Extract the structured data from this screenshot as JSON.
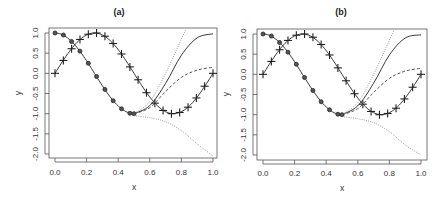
{
  "chart_data": [
    {
      "type": "line",
      "title": "(a)",
      "xlabel": "x",
      "ylabel": "y",
      "xlim": [
        0,
        1
      ],
      "ylim": [
        -2.1,
        1.1
      ],
      "xticks": [
        "0.0",
        "0.2",
        "0.4",
        "0.6",
        "0.8",
        "1.0"
      ],
      "yticks": [
        "1.0",
        "0.5",
        "0.0",
        "-0.5",
        "-1.0",
        "-1.5",
        "-2.0"
      ],
      "grid": false,
      "series": [
        {
          "name": "sin(2*pi*x) with + markers",
          "style": "solid",
          "marker": "+",
          "x": [
            0,
            0.053,
            0.105,
            0.158,
            0.211,
            0.263,
            0.316,
            0.368,
            0.421,
            0.474,
            0.526,
            0.579,
            0.632,
            0.684,
            0.737,
            0.789,
            0.842,
            0.895,
            0.947,
            1.0
          ],
          "y": [
            0,
            0.32,
            0.61,
            0.84,
            0.97,
            1.0,
            0.92,
            0.74,
            0.48,
            0.16,
            -0.16,
            -0.48,
            -0.74,
            -0.92,
            -1.0,
            -0.97,
            -0.84,
            -0.61,
            -0.32,
            0
          ]
        },
        {
          "name": "cos(2*pi*x) with circle markers",
          "style": "solid",
          "marker": "o",
          "x": [
            0,
            0.053,
            0.105,
            0.158,
            0.211,
            0.263,
            0.316,
            0.368,
            0.421,
            0.474,
            0.5
          ],
          "y": [
            1.0,
            0.95,
            0.79,
            0.55,
            0.25,
            -0.08,
            -0.4,
            -0.68,
            -0.88,
            -0.99,
            -1.0
          ]
        },
        {
          "name": "extrapolation solid",
          "style": "solid",
          "x": [
            0.5,
            0.6,
            0.7,
            0.8,
            0.9,
            1.0
          ],
          "y": [
            -1.0,
            -0.8,
            -0.25,
            0.45,
            0.88,
            0.98
          ]
        },
        {
          "name": "extrapolation dashed",
          "style": "dashed",
          "x": [
            0.5,
            0.6,
            0.7,
            0.8,
            0.9,
            1.0
          ],
          "y": [
            -1.0,
            -0.85,
            -0.45,
            -0.1,
            0.08,
            0.15
          ]
        },
        {
          "name": "extrapolation dotted up",
          "style": "dotted",
          "x": [
            0.5,
            0.6,
            0.7,
            0.8,
            0.83
          ],
          "y": [
            -1.0,
            -0.7,
            0.0,
            0.85,
            1.1
          ]
        },
        {
          "name": "extrapolation dotted down",
          "style": "dotted",
          "x": [
            0.5,
            0.6,
            0.7,
            0.8,
            0.9,
            1.0
          ],
          "y": [
            -1.05,
            -1.1,
            -1.2,
            -1.42,
            -1.75,
            -2.05
          ]
        }
      ]
    },
    {
      "type": "line",
      "title": "(b)",
      "xlabel": "x",
      "ylabel": "y",
      "xlim": [
        0,
        1
      ],
      "ylim": [
        -2.1,
        1.1
      ],
      "xticks": [
        "0.0",
        "0.2",
        "0.4",
        "0.6",
        "0.8",
        "1.0"
      ],
      "yticks": [
        "1.0",
        "0.5",
        "0.0",
        "-0.5",
        "-1.0",
        "-1.5",
        "-2.0"
      ],
      "grid": false,
      "series": [
        {
          "name": "sin(2*pi*x) with + markers",
          "style": "solid",
          "marker": "+",
          "x": [
            0,
            0.053,
            0.105,
            0.158,
            0.211,
            0.263,
            0.316,
            0.368,
            0.421,
            0.474,
            0.526,
            0.579,
            0.632,
            0.684,
            0.737,
            0.789,
            0.842,
            0.895,
            0.947,
            1.0
          ],
          "y": [
            0,
            0.32,
            0.61,
            0.84,
            0.97,
            1.0,
            0.92,
            0.74,
            0.48,
            0.16,
            -0.16,
            -0.48,
            -0.74,
            -0.92,
            -1.0,
            -0.97,
            -0.84,
            -0.61,
            -0.32,
            0
          ]
        },
        {
          "name": "cos(2*pi*x) with circle markers",
          "style": "solid",
          "marker": "o",
          "x": [
            0,
            0.053,
            0.105,
            0.158,
            0.211,
            0.263,
            0.316,
            0.368,
            0.421,
            0.474,
            0.5
          ],
          "y": [
            1.0,
            0.95,
            0.79,
            0.55,
            0.25,
            -0.08,
            -0.4,
            -0.68,
            -0.88,
            -0.99,
            -1.0
          ]
        },
        {
          "name": "extrapolation solid",
          "style": "solid",
          "x": [
            0.5,
            0.6,
            0.7,
            0.8,
            0.9,
            1.0
          ],
          "y": [
            -1.0,
            -0.78,
            -0.22,
            0.48,
            0.9,
            0.98
          ]
        },
        {
          "name": "extrapolation dashed",
          "style": "dashed",
          "x": [
            0.5,
            0.6,
            0.7,
            0.8,
            0.9,
            1.0
          ],
          "y": [
            -1.0,
            -0.85,
            -0.45,
            -0.1,
            0.08,
            0.15
          ]
        },
        {
          "name": "extrapolation dotted up",
          "style": "dotted",
          "x": [
            0.5,
            0.6,
            0.7,
            0.8,
            0.83
          ],
          "y": [
            -1.0,
            -0.7,
            0.0,
            0.85,
            1.1
          ]
        },
        {
          "name": "extrapolation dotted down",
          "style": "dotted",
          "x": [
            0.5,
            0.6,
            0.7,
            0.8,
            0.9,
            1.0
          ],
          "y": [
            -1.05,
            -1.1,
            -1.2,
            -1.42,
            -1.75,
            -2.0
          ]
        }
      ]
    }
  ],
  "layout": {
    "panels": [
      {
        "frame": [
          49,
          28,
          217,
          158
        ],
        "x0": 55,
        "x1": 213,
        "yTop": 33,
        "yBot": 154,
        "ymaxVal": 1.0,
        "yminVal": -2.0,
        "titleX": 119,
        "titleY": 15,
        "ylabX": 21,
        "ylabY": 93,
        "xlabX": 134,
        "xlabY": 190,
        "tickLabelX": 38,
        "xTickLabelY": 175
      },
      {
        "frame": [
          257,
          29,
          427,
          160
        ],
        "x0": 263,
        "x1": 421,
        "yTop": 34,
        "yBot": 155,
        "ymaxVal": 1.0,
        "yminVal": -2.0,
        "titleX": 341,
        "titleY": 15,
        "ylabX": 229,
        "ylabY": 94,
        "xlabX": 342,
        "xlabY": 191,
        "tickLabelX": 246,
        "xTickLabelY": 176
      }
    ],
    "colors": {
      "main": "#222222",
      "dashed": "#444444",
      "dotted": "#888888",
      "frame": "#555555"
    }
  }
}
